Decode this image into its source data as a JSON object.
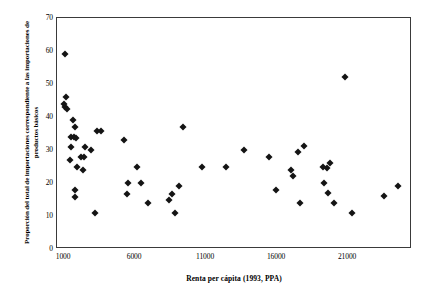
{
  "chart_data": {
    "type": "scatter",
    "title": "",
    "xlabel": "Renta per cápita (1993, PPA)",
    "ylabel": "Proporción del total de importaciones correspondiente a las importaciones de productos básicos",
    "xlim": [
      500,
      25500
    ],
    "ylim": [
      0,
      70
    ],
    "xticks": [
      1000,
      6000,
      11000,
      16000,
      21000
    ],
    "yticks": [
      0,
      10,
      20,
      30,
      40,
      50,
      60,
      70
    ],
    "grid": false,
    "legend": null,
    "marker": "diamond",
    "marker_color": "#141414",
    "points": [
      {
        "x": 1050,
        "y": 59
      },
      {
        "x": 1100,
        "y": 46
      },
      {
        "x": 1000,
        "y": 44
      },
      {
        "x": 1050,
        "y": 43
      },
      {
        "x": 1200,
        "y": 42.5
      },
      {
        "x": 1600,
        "y": 39
      },
      {
        "x": 1750,
        "y": 37
      },
      {
        "x": 1500,
        "y": 34
      },
      {
        "x": 1700,
        "y": 34
      },
      {
        "x": 1850,
        "y": 33.5
      },
      {
        "x": 1500,
        "y": 31
      },
      {
        "x": 2500,
        "y": 31
      },
      {
        "x": 1400,
        "y": 27
      },
      {
        "x": 2200,
        "y": 28
      },
      {
        "x": 2400,
        "y": 28
      },
      {
        "x": 2900,
        "y": 30
      },
      {
        "x": 3300,
        "y": 35.8
      },
      {
        "x": 3600,
        "y": 35.8
      },
      {
        "x": 1900,
        "y": 25
      },
      {
        "x": 2300,
        "y": 24
      },
      {
        "x": 1800,
        "y": 18
      },
      {
        "x": 1750,
        "y": 15.7
      },
      {
        "x": 3200,
        "y": 10.8
      },
      {
        "x": 5200,
        "y": 33
      },
      {
        "x": 5500,
        "y": 20
      },
      {
        "x": 5400,
        "y": 16.7
      },
      {
        "x": 6100,
        "y": 25
      },
      {
        "x": 6400,
        "y": 20
      },
      {
        "x": 6900,
        "y": 13.8
      },
      {
        "x": 8400,
        "y": 15
      },
      {
        "x": 8600,
        "y": 16.7
      },
      {
        "x": 8800,
        "y": 11
      },
      {
        "x": 9100,
        "y": 19
      },
      {
        "x": 9400,
        "y": 37
      },
      {
        "x": 10700,
        "y": 24.8
      },
      {
        "x": 12400,
        "y": 24.8
      },
      {
        "x": 13700,
        "y": 30
      },
      {
        "x": 15400,
        "y": 28
      },
      {
        "x": 15900,
        "y": 18
      },
      {
        "x": 17000,
        "y": 24
      },
      {
        "x": 17100,
        "y": 22
      },
      {
        "x": 17500,
        "y": 29.3
      },
      {
        "x": 17900,
        "y": 31.2
      },
      {
        "x": 17600,
        "y": 14
      },
      {
        "x": 19200,
        "y": 25
      },
      {
        "x": 19700,
        "y": 26
      },
      {
        "x": 19500,
        "y": 24.5
      },
      {
        "x": 19300,
        "y": 20
      },
      {
        "x": 19600,
        "y": 17
      },
      {
        "x": 20000,
        "y": 14
      },
      {
        "x": 20800,
        "y": 52
      },
      {
        "x": 21300,
        "y": 11
      },
      {
        "x": 23500,
        "y": 16
      },
      {
        "x": 24500,
        "y": 19
      }
    ]
  }
}
